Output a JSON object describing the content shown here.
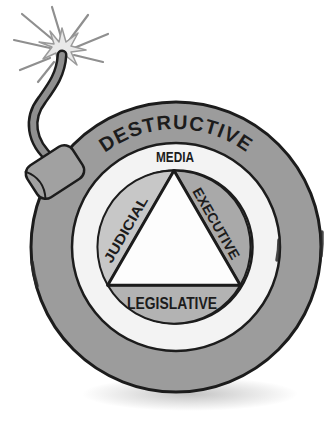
{
  "illustration": {
    "name": "ticking-bomb-separation-of-powers",
    "labels": {
      "destructive": "DESTRUCTIVE",
      "media": "MEDIA",
      "judicial": "JUDICIAL",
      "executive": "EXECUTIVE",
      "legislative": "LEGISLATIVE"
    },
    "colors": {
      "outer_ring": "#9c9c9c",
      "media_ring": "#f3f3f3",
      "judicial_segment": "#c7c7c7",
      "executive_segment": "#a9a9a9",
      "legislative_segment": "#b3b3b3",
      "triangle": "#fdfdfd",
      "outline": "#1c1c1c",
      "fuse": "#8f8f8f",
      "fuse_cap": "#a1a1a1",
      "spark": "#e9e9e9",
      "label_text": "#1c1c1c",
      "background": "#ffffff"
    },
    "icons": {
      "bomb": "bomb-icon",
      "fuse": "fuse-icon",
      "spark": "spark-icon"
    }
  }
}
